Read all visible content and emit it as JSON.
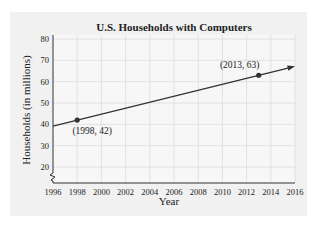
{
  "chart_data": {
    "type": "line",
    "title": "U.S. Households with Computers",
    "xlabel": "Year",
    "ylabel": "Households (in millions)",
    "x_ticks": [
      "1996",
      "1998",
      "2000",
      "2002",
      "2004",
      "2006",
      "2008",
      "2010",
      "2012",
      "2014",
      "2016"
    ],
    "y_ticks": [
      "20",
      "30",
      "40",
      "50",
      "60",
      "70",
      "80"
    ],
    "xlim": [
      1996,
      2016
    ],
    "ylim": [
      20,
      80
    ],
    "grid": true,
    "axis_break_y": true,
    "series": [
      {
        "name": "Households",
        "x": [
          1996,
          2016
        ],
        "y": [
          39.2,
          67.2
        ],
        "style": "line with arrow"
      }
    ],
    "points": [
      {
        "x": 1998,
        "y": 42,
        "label": "(1998, 42)"
      },
      {
        "x": 2013,
        "y": 63,
        "label": "(2013, 63)"
      }
    ]
  }
}
